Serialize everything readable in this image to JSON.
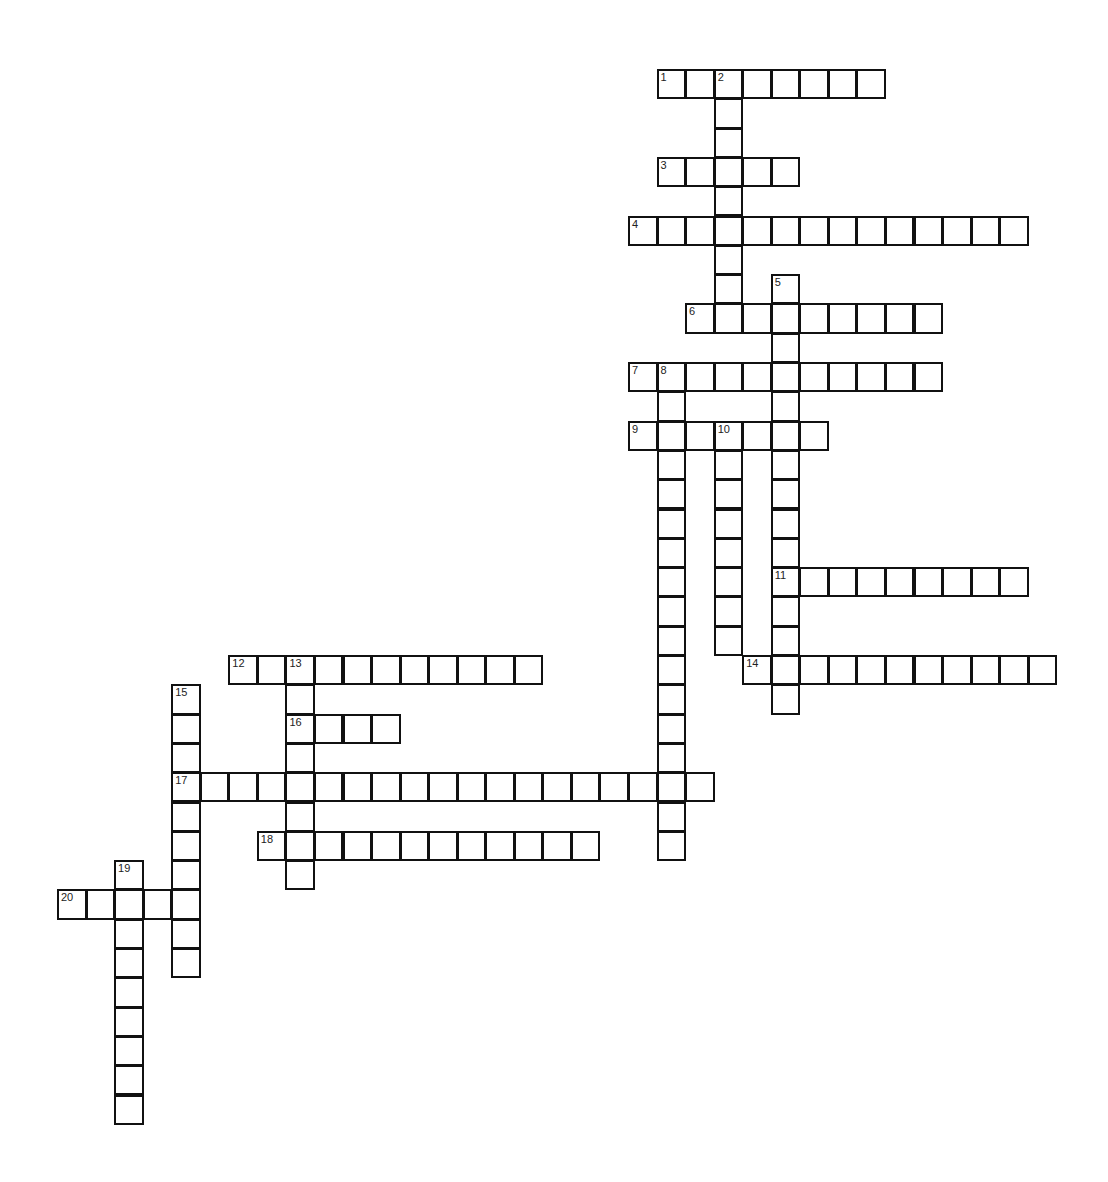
{
  "puzzle": {
    "title": "",
    "grid_origin": {
      "x": 58,
      "y": 70
    },
    "cell_size": {
      "w": 28.55,
      "h": 29.3
    },
    "border_color": "#111111",
    "background": "#ffffff",
    "entries": [
      {
        "number": "1",
        "direction": "across",
        "row": 0,
        "col": 21,
        "length": 8
      },
      {
        "number": "2",
        "direction": "down",
        "row": 0,
        "col": 23,
        "length": 9
      },
      {
        "number": "3",
        "direction": "across",
        "row": 3,
        "col": 21,
        "length": 5
      },
      {
        "number": "4",
        "direction": "across",
        "row": 5,
        "col": 20,
        "length": 14
      },
      {
        "number": "5",
        "direction": "down",
        "row": 7,
        "col": 25,
        "length": 15
      },
      {
        "number": "6",
        "direction": "across",
        "row": 8,
        "col": 22,
        "length": 9
      },
      {
        "number": "7",
        "direction": "across",
        "row": 10,
        "col": 20,
        "length": 11
      },
      {
        "number": "8",
        "direction": "down",
        "row": 10,
        "col": 21,
        "length": 17
      },
      {
        "number": "9",
        "direction": "across",
        "row": 12,
        "col": 20,
        "length": 7
      },
      {
        "number": "10",
        "direction": "down",
        "row": 12,
        "col": 23,
        "length": 8
      },
      {
        "number": "11",
        "direction": "across",
        "row": 17,
        "col": 25,
        "length": 9
      },
      {
        "number": "12",
        "direction": "across",
        "row": 20,
        "col": 6,
        "length": 11
      },
      {
        "number": "13",
        "direction": "down",
        "row": 20,
        "col": 8,
        "length": 8
      },
      {
        "number": "14",
        "direction": "across",
        "row": 20,
        "col": 24,
        "length": 11
      },
      {
        "number": "15",
        "direction": "down",
        "row": 21,
        "col": 4,
        "length": 10
      },
      {
        "number": "16",
        "direction": "across",
        "row": 22,
        "col": 8,
        "length": 4
      },
      {
        "number": "17",
        "direction": "across",
        "row": 24,
        "col": 4,
        "length": 19
      },
      {
        "number": "18",
        "direction": "across",
        "row": 26,
        "col": 7,
        "length": 12
      },
      {
        "number": "19",
        "direction": "down",
        "row": 27,
        "col": 2,
        "length": 9
      },
      {
        "number": "20",
        "direction": "across",
        "row": 28,
        "col": 0,
        "length": 5
      }
    ]
  }
}
